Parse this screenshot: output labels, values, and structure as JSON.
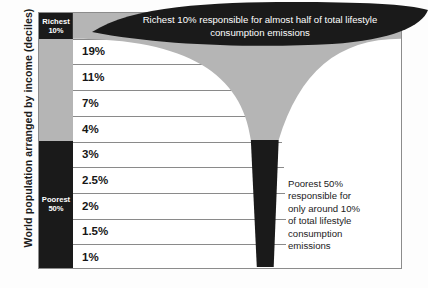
{
  "axis": {
    "y_title": "World population arranged by income (deciles)"
  },
  "deciles": {
    "richest_label_line1": "Richest",
    "richest_label_line2": "10%",
    "poorest_label_line1": "Poorest",
    "poorest_label_line2": "50%"
  },
  "banner": {
    "line1": "Richest 10% responsible for almost half of total lifestyle",
    "line2": "consumption emissions"
  },
  "caption": {
    "line1": "Poorest 50%",
    "line2": "responsible for",
    "line3": "only around 10%",
    "line4": "of total lifestyle",
    "line5": "consumption",
    "line6": "emissions"
  },
  "colors": {
    "dark": "#1a1a1a",
    "gray": "#b5b5b5",
    "grid": "#8a8a8a",
    "frame": "#8c8c8c",
    "background": "#fdfdfd"
  },
  "chart_data": {
    "type": "bar",
    "xlabel": "",
    "ylabel": "World population arranged by income (deciles)",
    "categories": [
      "Richest 10%",
      "Decile 2",
      "Decile 3",
      "Decile 4",
      "Decile 5",
      "Decile 6",
      "Decile 7",
      "Decile 8",
      "Decile 9",
      "Poorest decile"
    ],
    "values": [
      49,
      19,
      11,
      7,
      4,
      3,
      2.5,
      2,
      1.5,
      1
    ],
    "value_labels": [
      "49%",
      "19%",
      "11%",
      "7%",
      "4%",
      "3%",
      "2.5%",
      "2%",
      "1.5%",
      "1%"
    ],
    "unit": "%",
    "grid": true,
    "legend": false,
    "annotations": [
      "Richest 10% responsible for almost half of total lifestyle consumption emissions",
      "Poorest 50% responsible for only around 10% of total lifestyle consumption emissions"
    ],
    "groups": [
      {
        "name": "Richest 10%",
        "rows": [
          0
        ],
        "color": "#1a1a1a"
      },
      {
        "name": "Middle 40%",
        "rows": [
          1,
          2,
          3,
          4
        ],
        "color": "#b5b5b5"
      },
      {
        "name": "Poorest 50%",
        "rows": [
          5,
          6,
          7,
          8,
          9
        ],
        "color": "#1a1a1a"
      }
    ]
  }
}
